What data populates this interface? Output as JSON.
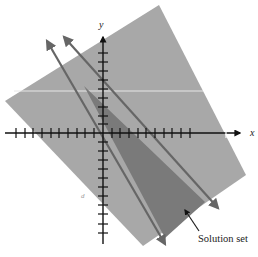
{
  "figure": {
    "x_axis_label": "x",
    "y_axis_label": "y",
    "annotation": "Solution set",
    "stray_mark": "d",
    "colors": {
      "background": "#ffffff",
      "half_plane_fill": "#a8a8a8",
      "solution_fill": "#7a7a7a",
      "boundary_line": "#6a6a6a",
      "axis": "#111111",
      "highlight_line": "#e6e6e6"
    },
    "axes": {
      "x_ticks_left": 10,
      "x_ticks_right": 10,
      "y_ticks_up": 8,
      "y_ticks_down": 12
    },
    "boundary_lines": [
      {
        "name": "line-1",
        "style": "solid with arrows at both ends"
      },
      {
        "name": "line-2",
        "style": "solid with arrows at both ends"
      }
    ]
  }
}
